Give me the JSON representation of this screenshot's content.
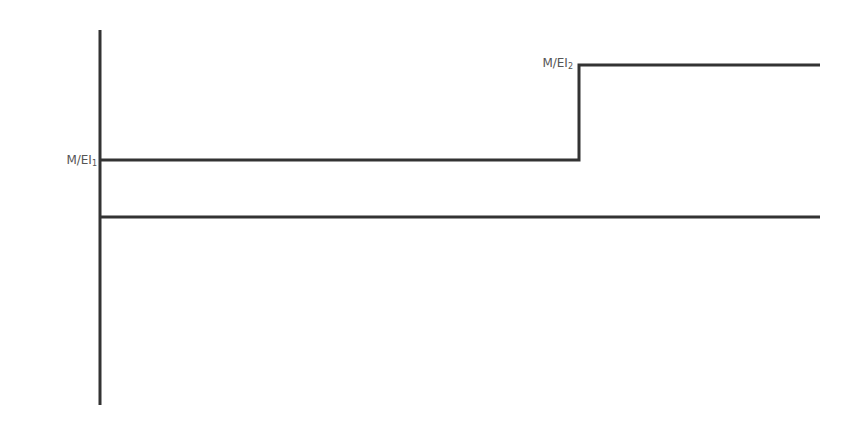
{
  "diagram": {
    "type": "step M/EI diagram",
    "labels": {
      "ei1": {
        "main": "M/EI",
        "sub": "1"
      },
      "ei2": {
        "main": "M/EI",
        "sub": "2"
      }
    },
    "colors": {
      "stroke": "#333333",
      "label": "#555555",
      "background": "#ffffff"
    },
    "geometry": {
      "axis": {
        "x": 100,
        "y_top": 30,
        "y_bottom": 405
      },
      "baseline": {
        "y": 217,
        "x_start": 100,
        "x_end": 820
      },
      "step": {
        "level1_y": 160,
        "step_x": 579,
        "level2_y": 65,
        "x_start": 100,
        "x_end": 820
      }
    }
  }
}
